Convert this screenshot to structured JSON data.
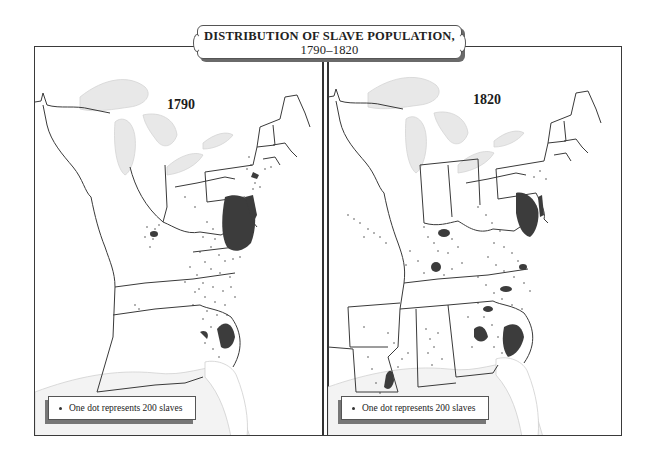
{
  "title": {
    "line1": "DISTRIBUTION OF SLAVE POPULATION,",
    "line2": "1790–1820"
  },
  "maps": [
    {
      "year": "1790",
      "legend": {
        "symbol": "dot",
        "text": "One dot represents 200 slaves"
      },
      "dense_regions": [
        "Virginia / Chesapeake tidewater",
        "Maryland eastern shore",
        "South Carolina lowcountry",
        "Georgia coast",
        "New York / New Jersey Hudson valley"
      ],
      "sparse_regions": [
        "North Carolina piedmont",
        "Kentucky bluegrass",
        "Tennessee"
      ]
    },
    {
      "year": "1820",
      "legend": {
        "symbol": "dot",
        "text": "One dot represents 200 slaves"
      },
      "dense_regions": [
        "Virginia / Chesapeake",
        "South Carolina lowcountry",
        "Georgia coast",
        "Kentucky bluegrass",
        "Middle Tennessee",
        "Lower Mississippi / Louisiana"
      ],
      "sparse_regions": [
        "Alabama black belt",
        "Mississippi",
        "Missouri",
        "Arkansas",
        "North Carolina"
      ]
    }
  ],
  "colors": {
    "land": "#ffffff",
    "water": "#e6e6e6",
    "border": "#3a3a3a",
    "dots": "#2e2e2e",
    "dense_fill": "#3c3c3c"
  }
}
